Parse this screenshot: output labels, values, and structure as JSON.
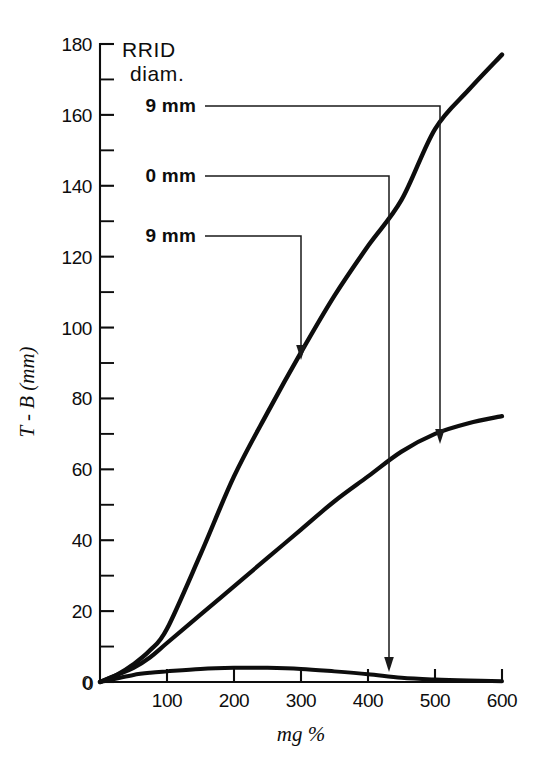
{
  "chart_data": {
    "type": "line",
    "title": "",
    "xlabel": "mg %",
    "ylabel": "T - B (mm)",
    "xlim": [
      0,
      600
    ],
    "ylim": [
      0,
      180
    ],
    "grid": false,
    "legend_position": "upper-left-inside",
    "legend_title_line1": "RRID",
    "legend_title_line2": "diam.",
    "x_ticks": [
      "0",
      "100",
      "200",
      "300",
      "400",
      "500",
      "600"
    ],
    "x_tick_values": [
      0,
      100,
      200,
      300,
      400,
      500,
      600
    ],
    "y_ticks": [
      "0",
      "20",
      "40",
      "60",
      "80",
      "100",
      "120",
      "140",
      "160",
      "180"
    ],
    "y_tick_values": [
      0,
      20,
      40,
      60,
      80,
      100,
      120,
      140,
      160,
      180
    ],
    "y_minor_tick_values": [
      10,
      30,
      50,
      70,
      90,
      110,
      130,
      150,
      170
    ],
    "series": [
      {
        "name": "9 mm (upper)",
        "label": "9 mm",
        "x": [
          0,
          25,
          50,
          75,
          100,
          150,
          200,
          250,
          300,
          350,
          400,
          450,
          500,
          550,
          600
        ],
        "values": [
          0,
          2,
          5,
          9,
          15,
          36,
          58,
          76,
          93,
          109,
          123,
          136,
          156,
          167,
          177
        ]
      },
      {
        "name": "0 mm (middle)",
        "label": "0 mm",
        "x": [
          0,
          25,
          50,
          75,
          100,
          150,
          200,
          250,
          300,
          350,
          400,
          450,
          500,
          550,
          600
        ],
        "values": [
          0,
          2,
          4,
          7,
          11,
          19,
          27,
          35,
          43,
          51,
          58,
          65,
          70,
          73,
          75
        ]
      },
      {
        "name": "9 mm (lower)",
        "label": "9 mm",
        "x": [
          0,
          25,
          50,
          75,
          100,
          150,
          200,
          250,
          300,
          350,
          400,
          450,
          500,
          550,
          600
        ],
        "values": [
          0,
          1,
          2,
          2.6,
          3,
          3.7,
          4,
          4,
          3.7,
          3,
          2.2,
          1.2,
          0.7,
          0.4,
          0.2
        ]
      }
    ],
    "annotations": [
      {
        "label": "9 mm",
        "target_series": "0 mm (middle)",
        "target_x": 500,
        "target_y": 72
      },
      {
        "label": "0 mm",
        "target_series": "9 mm (lower)",
        "target_x": 430,
        "target_y": 2
      },
      {
        "label": "9 mm",
        "target_series": "9 mm (upper)",
        "target_x": 300,
        "target_y": 92
      }
    ],
    "colors": {
      "curve": "#0d0d0d",
      "axis": "#0d0d0d",
      "leader": "#1a1a1a",
      "background": "#ffffff"
    }
  }
}
